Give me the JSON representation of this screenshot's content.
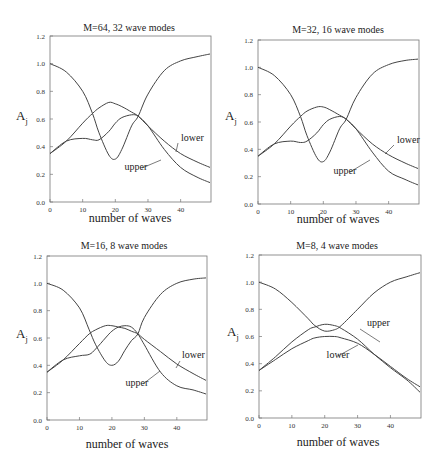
{
  "figure": {
    "ylabel_main": "A",
    "ylabel_sub": "j",
    "xlabel": "number of waves"
  },
  "chart_data": [
    {
      "type": "line",
      "title": "M=64, 32 wave modes",
      "xlabel": "number of waves",
      "ylabel": "A_j",
      "xlim": [
        0,
        50
      ],
      "ylim": [
        0.0,
        1.2
      ],
      "xticks": [
        "0",
        "10",
        "20",
        "30",
        "40"
      ],
      "yticks": [
        "0.0",
        "0.2",
        "0.4",
        "0.6",
        "0.8",
        "1.0",
        "1.2"
      ],
      "grid": false,
      "annotations": [
        "lower",
        "upper"
      ],
      "x": [
        0,
        5,
        10,
        13,
        15,
        18,
        20,
        22,
        25,
        27,
        30,
        35,
        40,
        45,
        49
      ],
      "series": [
        {
          "name": "reference",
          "values": [
            1.0,
            0.94,
            0.8,
            0.64,
            0.5,
            0.34,
            0.31,
            0.38,
            0.55,
            0.62,
            0.78,
            0.95,
            1.02,
            1.05,
            1.07
          ]
        },
        {
          "name": "lower",
          "values": [
            0.35,
            0.44,
            0.57,
            0.64,
            0.68,
            0.72,
            0.71,
            0.69,
            0.65,
            0.62,
            0.55,
            0.44,
            0.35,
            0.29,
            0.25
          ]
        },
        {
          "name": "upper",
          "values": [
            0.35,
            0.44,
            0.46,
            0.45,
            0.45,
            0.51,
            0.57,
            0.61,
            0.63,
            0.62,
            0.55,
            0.38,
            0.25,
            0.18,
            0.14
          ]
        }
      ]
    },
    {
      "type": "line",
      "title": "M=32, 16 wave modes",
      "xlabel": "number of waves",
      "ylabel": "A_j",
      "xlim": [
        0,
        50
      ],
      "ylim": [
        0.0,
        1.2
      ],
      "xticks": [
        "0",
        "10",
        "20",
        "30",
        "40"
      ],
      "yticks": [
        "0.0",
        "0.2",
        "0.4",
        "0.6",
        "0.8",
        "1.0",
        "1.2"
      ],
      "grid": false,
      "annotations": [
        "lower",
        "upper"
      ],
      "x": [
        0,
        5,
        10,
        13,
        15,
        18,
        20,
        22,
        25,
        27,
        30,
        35,
        40,
        45,
        49
      ],
      "series": [
        {
          "name": "reference",
          "values": [
            1.0,
            0.94,
            0.8,
            0.64,
            0.5,
            0.34,
            0.31,
            0.38,
            0.55,
            0.62,
            0.78,
            0.95,
            1.02,
            1.05,
            1.06
          ]
        },
        {
          "name": "lower",
          "values": [
            0.35,
            0.44,
            0.57,
            0.64,
            0.68,
            0.71,
            0.71,
            0.69,
            0.65,
            0.62,
            0.55,
            0.44,
            0.36,
            0.3,
            0.26
          ]
        },
        {
          "name": "upper",
          "values": [
            0.35,
            0.44,
            0.46,
            0.45,
            0.46,
            0.52,
            0.58,
            0.62,
            0.64,
            0.62,
            0.55,
            0.38,
            0.24,
            0.18,
            0.14
          ]
        }
      ]
    },
    {
      "type": "line",
      "title": "M=16, 8 wave modes",
      "xlabel": "number of waves",
      "ylabel": "A_j",
      "xlim": [
        0,
        50
      ],
      "ylim": [
        0.0,
        1.2
      ],
      "xticks": [
        "0",
        "10",
        "20",
        "30",
        "40"
      ],
      "yticks": [
        "0.0",
        "0.2",
        "0.4",
        "0.6",
        "0.8",
        "1.0",
        "1.2"
      ],
      "grid": false,
      "annotations": [
        "lower",
        "upper"
      ],
      "x": [
        0,
        5,
        10,
        13,
        15,
        18,
        20,
        22,
        24,
        26,
        28,
        30,
        35,
        40,
        45,
        49
      ],
      "series": [
        {
          "name": "reference",
          "values": [
            1.0,
            0.95,
            0.82,
            0.66,
            0.55,
            0.43,
            0.4,
            0.43,
            0.51,
            0.58,
            0.63,
            0.75,
            0.92,
            1.0,
            1.03,
            1.04
          ]
        },
        {
          "name": "lower",
          "values": [
            0.35,
            0.44,
            0.56,
            0.63,
            0.66,
            0.69,
            0.69,
            0.68,
            0.67,
            0.65,
            0.63,
            0.59,
            0.5,
            0.41,
            0.34,
            0.29
          ]
        },
        {
          "name": "upper",
          "values": [
            0.35,
            0.44,
            0.47,
            0.48,
            0.52,
            0.6,
            0.65,
            0.68,
            0.69,
            0.68,
            0.63,
            0.55,
            0.35,
            0.25,
            0.22,
            0.19
          ]
        }
      ]
    },
    {
      "type": "line",
      "title": "M=8, 4 wave modes",
      "xlabel": "number of waves",
      "ylabel": "A_j",
      "xlim": [
        0,
        50
      ],
      "ylim": [
        0.0,
        1.2
      ],
      "xticks": [
        "0",
        "10",
        "20",
        "30",
        "40"
      ],
      "yticks": [
        "0.0",
        "0.2",
        "0.4",
        "0.6",
        "0.8",
        "1.0",
        "1.2"
      ],
      "grid": false,
      "annotations": [
        "upper",
        "lower"
      ],
      "x": [
        0,
        5,
        10,
        15,
        17,
        20,
        23,
        25,
        30,
        35,
        40,
        45,
        49
      ],
      "series": [
        {
          "name": "reference",
          "values": [
            1.0,
            0.95,
            0.85,
            0.73,
            0.68,
            0.64,
            0.65,
            0.68,
            0.8,
            0.92,
            1.0,
            1.04,
            1.07
          ]
        },
        {
          "name": "upper",
          "values": [
            0.35,
            0.45,
            0.56,
            0.65,
            0.67,
            0.69,
            0.68,
            0.66,
            0.58,
            0.47,
            0.37,
            0.28,
            0.19
          ]
        },
        {
          "name": "lower",
          "values": [
            0.35,
            0.43,
            0.51,
            0.57,
            0.59,
            0.6,
            0.6,
            0.59,
            0.55,
            0.47,
            0.38,
            0.29,
            0.23
          ]
        }
      ]
    }
  ]
}
